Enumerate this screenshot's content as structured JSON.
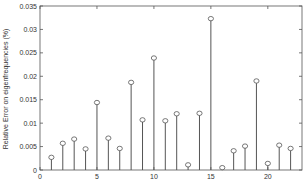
{
  "chart_data": {
    "type": "stem",
    "title": "",
    "xlabel": "",
    "ylabel": "Relative Error on eigenfrequencies (%)",
    "xlim": [
      0,
      23
    ],
    "ylim": [
      0,
      0.035
    ],
    "xticks": [
      0,
      5,
      10,
      15,
      20
    ],
    "xtick_labels": [
      "0",
      "5",
      "10",
      "15",
      "20"
    ],
    "yticks": [
      0,
      0.005,
      0.01,
      0.015,
      0.02,
      0.025,
      0.03,
      0.035
    ],
    "ytick_labels": [
      "0",
      "0.005",
      "0.01",
      "0.015",
      "0.02",
      "0.025",
      "0.03",
      "0.035"
    ],
    "grid": false,
    "legend": null,
    "x": [
      1,
      2,
      3,
      4,
      5,
      6,
      7,
      8,
      9,
      10,
      11,
      12,
      13,
      14,
      15,
      16,
      17,
      18,
      19,
      20,
      21,
      22
    ],
    "values": [
      0.0027,
      0.0057,
      0.0066,
      0.0045,
      0.0144,
      0.0068,
      0.0046,
      0.0187,
      0.0107,
      0.0239,
      0.0105,
      0.012,
      0.0011,
      0.0121,
      0.0323,
      0.0005,
      0.0041,
      0.0051,
      0.019,
      0.0014,
      0.0053,
      0.0046
    ],
    "colors": {
      "stem": "#555555",
      "marker": "#555555",
      "axes": "#555555"
    }
  }
}
